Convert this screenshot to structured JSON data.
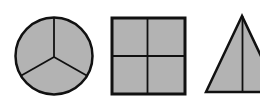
{
  "figure": {
    "fill_color": "#b3b3b3",
    "stroke_color": "#111111",
    "background": "#ffffff",
    "shapes": [
      {
        "type": "circle",
        "parts": 3,
        "cx": 54,
        "cy": 56,
        "r": 38.5,
        "center_y": 57
      },
      {
        "type": "square",
        "parts": 4,
        "x": 111,
        "y": 17,
        "size": 75
      },
      {
        "type": "triangle",
        "parts": 2,
        "apex": [
          242,
          16
        ],
        "base_left": [
          206,
          92
        ],
        "base_right": [
          278,
          92
        ]
      }
    ]
  }
}
